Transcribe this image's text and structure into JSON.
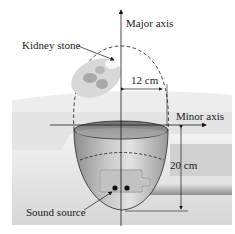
{
  "diagram": {
    "labels": {
      "major_axis": "Major axis",
      "minor_axis": "Minor axis",
      "kidney_stone": "Kidney stone",
      "sound_source": "Sound source",
      "semi_minor": "12 cm",
      "depth": "20 cm"
    },
    "colors": {
      "background": "#ffffff",
      "body_tissue": "#d9d9d9",
      "tissue_light": "#ececec",
      "bowl_dark": "#8a8a8a",
      "bowl_mid": "#b4b4b4",
      "bowl_light": "#e0e0e0",
      "lines": "#1a1a1a",
      "kidney": "#cfcfcf",
      "kidney_inner": "#a8a8a8"
    }
  }
}
